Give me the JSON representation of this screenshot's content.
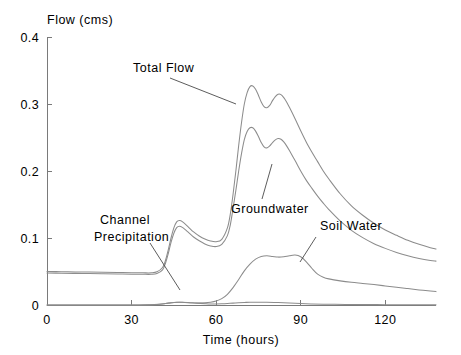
{
  "chart_data": {
    "type": "line",
    "title": "",
    "xlabel": "Time (hours)",
    "ylabel": "Flow (cms)",
    "xlim": [
      0,
      138
    ],
    "ylim": [
      0,
      0.4
    ],
    "xticks": [
      0,
      30,
      60,
      90,
      120
    ],
    "xtick_labels": [
      "0",
      "30",
      "60",
      "90",
      "120"
    ],
    "yticks": [
      0,
      0.1,
      0.2,
      0.3,
      0.4
    ],
    "ytick_labels": [
      "0",
      "0.1",
      "0.2",
      "0.3",
      "0.4"
    ],
    "grid": false,
    "legend": "inline-annotations",
    "series": [
      {
        "name": "Total Flow",
        "label_text": "Total Flow",
        "x": [
          0,
          5,
          10,
          15,
          20,
          25,
          30,
          34,
          37,
          39,
          41,
          42,
          43,
          44,
          45,
          46,
          47,
          48,
          50,
          52,
          54,
          56,
          58,
          60,
          62,
          64,
          65,
          66,
          67,
          68,
          69,
          70,
          71,
          72,
          73,
          74,
          75,
          76,
          77,
          78,
          79,
          80,
          81,
          82,
          83,
          84,
          85,
          86,
          88,
          90,
          92,
          94,
          96,
          98,
          100,
          104,
          108,
          112,
          116,
          120,
          124,
          128,
          132,
          136,
          138
        ],
        "y": [
          0.05,
          0.0497,
          0.0494,
          0.0491,
          0.0488,
          0.0485,
          0.0482,
          0.048,
          0.048,
          0.0495,
          0.056,
          0.066,
          0.082,
          0.1,
          0.115,
          0.124,
          0.126,
          0.1245,
          0.117,
          0.109,
          0.103,
          0.0985,
          0.0955,
          0.0945,
          0.098,
          0.115,
          0.135,
          0.165,
          0.2,
          0.238,
          0.272,
          0.3,
          0.317,
          0.326,
          0.327,
          0.322,
          0.313,
          0.303,
          0.296,
          0.2945,
          0.298,
          0.305,
          0.311,
          0.3145,
          0.314,
          0.3095,
          0.303,
          0.295,
          0.278,
          0.26,
          0.243,
          0.228,
          0.214,
          0.2,
          0.188,
          0.166,
          0.148,
          0.134,
          0.122,
          0.112,
          0.104,
          0.0965,
          0.0905,
          0.0855,
          0.0835
        ]
      },
      {
        "name": "Groundwater",
        "label_text": "Groundwater",
        "x": [
          0,
          5,
          10,
          15,
          20,
          25,
          30,
          34,
          37,
          39,
          41,
          42,
          43,
          44,
          45,
          46,
          47,
          48,
          50,
          52,
          54,
          56,
          58,
          60,
          62,
          64,
          65,
          66,
          67,
          68,
          69,
          70,
          71,
          72,
          73,
          74,
          75,
          76,
          77,
          78,
          79,
          80,
          81,
          82,
          83,
          84,
          85,
          86,
          88,
          90,
          92,
          94,
          96,
          98,
          100,
          104,
          108,
          112,
          116,
          120,
          124,
          128,
          132,
          136,
          138
        ],
        "y": [
          0.0478,
          0.0475,
          0.0472,
          0.0469,
          0.0466,
          0.0463,
          0.046,
          0.0458,
          0.0458,
          0.047,
          0.0525,
          0.062,
          0.0765,
          0.0935,
          0.107,
          0.1155,
          0.1175,
          0.1158,
          0.109,
          0.1015,
          0.0958,
          0.0912,
          0.0882,
          0.0872,
          0.0905,
          0.1035,
          0.119,
          0.144,
          0.171,
          0.2,
          0.226,
          0.247,
          0.259,
          0.2645,
          0.2645,
          0.2595,
          0.2515,
          0.2425,
          0.236,
          0.2345,
          0.2375,
          0.2425,
          0.2465,
          0.2485,
          0.2475,
          0.2435,
          0.2375,
          0.2305,
          0.2155,
          0.2,
          0.186,
          0.174,
          0.1625,
          0.152,
          0.1425,
          0.1255,
          0.1115,
          0.1005,
          0.0915,
          0.0845,
          0.0785,
          0.0735,
          0.0695,
          0.0665,
          0.0655
        ]
      },
      {
        "name": "Soil Water",
        "label_text": "Soil Water",
        "x": [
          0,
          10,
          20,
          30,
          38,
          42,
          44,
          46,
          48,
          50,
          53,
          56,
          58,
          60,
          62,
          64,
          66,
          68,
          70,
          72,
          74,
          76,
          78,
          80,
          82,
          84,
          86,
          88,
          90,
          92,
          94,
          96,
          98,
          100,
          104,
          108,
          112,
          116,
          120,
          124,
          128,
          132,
          136,
          138
        ],
        "y": [
          0.0,
          0.0,
          0.0,
          0.0,
          0.0008,
          0.0022,
          0.0035,
          0.0042,
          0.004,
          0.0035,
          0.003,
          0.0032,
          0.004,
          0.0058,
          0.0095,
          0.016,
          0.026,
          0.038,
          0.051,
          0.061,
          0.0685,
          0.0725,
          0.0735,
          0.0725,
          0.0715,
          0.072,
          0.0735,
          0.0745,
          0.072,
          0.0645,
          0.0545,
          0.046,
          0.0415,
          0.039,
          0.036,
          0.0338,
          0.0322,
          0.0305,
          0.0285,
          0.0265,
          0.0245,
          0.0225,
          0.0208,
          0.02
        ]
      },
      {
        "name": "Channel Precipitation",
        "label_text": "Channel Precipitation",
        "x": [
          0,
          10,
          20,
          28,
          32,
          36,
          40,
          43,
          45,
          47,
          50,
          53,
          56,
          58,
          60,
          62,
          64,
          66,
          68,
          70,
          72,
          75,
          78,
          82,
          86,
          90,
          94,
          98,
          102,
          108,
          114,
          120,
          126,
          132,
          138
        ],
        "y": [
          0.0,
          0.0,
          0.0,
          0.0,
          0.0,
          0.0002,
          0.0012,
          0.0028,
          0.0038,
          0.0042,
          0.0038,
          0.0028,
          0.002,
          0.0016,
          0.0016,
          0.0018,
          0.0022,
          0.0028,
          0.0034,
          0.0038,
          0.004,
          0.0042,
          0.004,
          0.0036,
          0.003,
          0.0022,
          0.0016,
          0.0012,
          0.001,
          0.0008,
          0.0006,
          0.0005,
          0.0004,
          0.0003,
          0.0002
        ]
      }
    ],
    "annotations": [
      {
        "name": "total-flow",
        "text": "Total Flow",
        "label_x": 133,
        "label_y": 72,
        "leader": [
          [
            170,
            78
          ],
          [
            236,
            104
          ]
        ]
      },
      {
        "name": "channel-precipitation",
        "text_line1": "Channel",
        "text_line2": "Precipitation",
        "label_x": 100,
        "label_y": 224,
        "leader": [
          [
            150,
            243
          ],
          [
            180,
            290
          ]
        ]
      },
      {
        "name": "groundwater",
        "text": "Groundwater",
        "label_x": 231,
        "label_y": 213,
        "leader": [
          [
            262,
            199
          ],
          [
            272,
            164
          ]
        ]
      },
      {
        "name": "soil-water",
        "text": "Soil Water",
        "label_x": 320,
        "label_y": 230,
        "leader": [
          [
            316,
            237
          ],
          [
            300,
            262
          ]
        ]
      }
    ]
  },
  "plot_geometry": {
    "left": 47,
    "right": 436,
    "top": 37,
    "bottom": 305
  },
  "colors": {
    "curve": "#8c8c8c",
    "axis": "#7a7a7a",
    "text": "#000000",
    "background": "#ffffff"
  }
}
